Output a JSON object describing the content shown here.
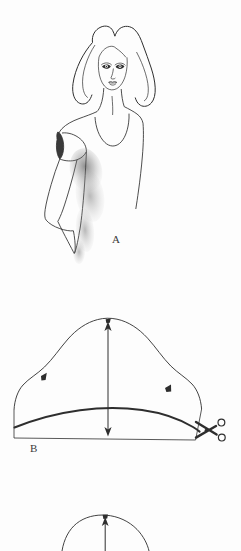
{
  "page": {
    "background_color": "#fdfdfd",
    "ink_color": "#2e2e2e",
    "width": 241,
    "height": 551
  },
  "figures": [
    {
      "id": "figure-a",
      "label": "A",
      "caption": "A",
      "type": "fashion-croquis",
      "description": "Front view fashion illustration of a female figure with shoulder-length hair wearing a scoop-neck cap-sleeve top, shaded under the left arm",
      "elements": [
        "hair",
        "face",
        "eyes",
        "nose",
        "lips",
        "neck",
        "scoop-neckline",
        "cap-sleeve",
        "arm",
        "bodice",
        "underarm-shading"
      ]
    },
    {
      "id": "figure-b",
      "label": "B",
      "caption": "B",
      "type": "sleeve-cap-pattern",
      "description": "Sleeve cap pattern piece with bell-shaped cap curve, bold lowered cap line, straight hem line, double-headed vertical cap-height arrow, notch marks and scissors indicating cut line",
      "elements": [
        "cap-curve",
        "bold-cut-line",
        "hem-line",
        "left-side-seam",
        "right-side-seam",
        "cap-height-arrow",
        "apex-notch",
        "left-notch",
        "right-notch",
        "scissors-icon"
      ]
    },
    {
      "id": "figure-c",
      "label": "",
      "caption": "",
      "type": "sleeve-cap-pattern-partial",
      "description": "Third diagram partially visible at the bottom edge of the page: top of a cap curve with an apex notch and an upward pointing arrow",
      "elements": [
        "cap-curve-partial",
        "apex-notch",
        "up-arrow"
      ]
    }
  ],
  "markers": {
    "apex_notch": "notch-mark",
    "grainline_arrow": "double-headed-arrow",
    "cut_indicator": "scissors-icon"
  }
}
